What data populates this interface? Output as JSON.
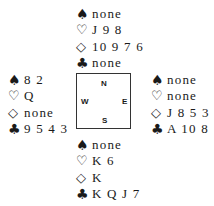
{
  "symbols": {
    "spades": "♠",
    "hearts": "♡",
    "diamonds": "◇",
    "clubs": "♣"
  },
  "compass": {
    "north": "N",
    "west": "W",
    "east": "E",
    "south": "S"
  },
  "hands": {
    "north": {
      "spades": "none",
      "hearts": "J 9 8",
      "diamonds": "10 9 7 6",
      "clubs": "none"
    },
    "west": {
      "spades": "8 2",
      "hearts": "Q",
      "diamonds": "none",
      "clubs": "9 5 4 3"
    },
    "east": {
      "spades": "none",
      "hearts": "none",
      "diamonds": "J 8 5 3",
      "clubs": "A 10 8"
    },
    "south": {
      "spades": "none",
      "hearts": "K 6",
      "diamonds": "K",
      "clubs": "K Q J 7"
    }
  }
}
